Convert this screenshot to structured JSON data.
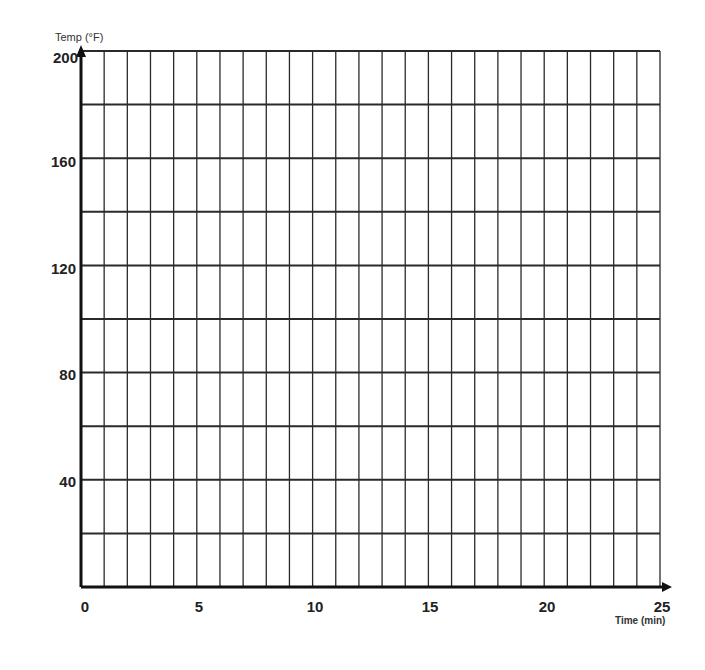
{
  "chart_data": {
    "type": "line",
    "title": "",
    "xlabel": "Time (min)",
    "ylabel": "Temp (°F)",
    "xlim": [
      0,
      25
    ],
    "ylim": [
      0,
      200
    ],
    "x_tick_labels": [
      "0",
      "5",
      "10",
      "15",
      "20",
      "25"
    ],
    "x_ticks": [
      0,
      5,
      10,
      15,
      20,
      25
    ],
    "y_tick_labels": [
      "40",
      "80",
      "120",
      "160",
      "200"
    ],
    "y_ticks": [
      40,
      80,
      120,
      160,
      200
    ],
    "grid": true,
    "x_grid_step": 1,
    "y_grid_step": 20,
    "series": [],
    "legend": null,
    "note": "Blank graph grid with no data plotted"
  },
  "colors": {
    "grid": "#2a2a2a",
    "axis": "#111111"
  }
}
